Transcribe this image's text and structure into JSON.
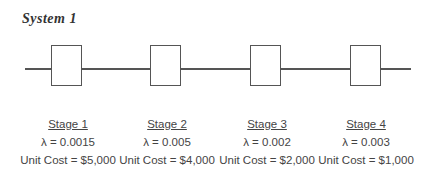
{
  "title": "System 1",
  "stages": [
    {
      "name": "Stage 1",
      "lambda": "λ = 0.0015",
      "cost": "Unit Cost = $5,000"
    },
    {
      "name": "Stage 2",
      "lambda": "λ  = 0.005",
      "cost": "Unit Cost = $4,000"
    },
    {
      "name": "Stage 3",
      "lambda": "λ = 0.002",
      "cost": "Unit Cost = $2,000"
    },
    {
      "name": "Stage 4",
      "lambda": "λ = 0.003",
      "cost": "Unit Cost = $1,000"
    }
  ]
}
